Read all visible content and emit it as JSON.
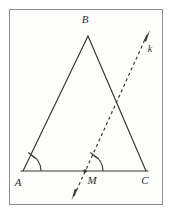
{
  "figure": {
    "background_color": "#fdfdfb",
    "page_background": "#ffffff",
    "stroke_color": "#3a3a3a",
    "border_color": "#8d8d8d",
    "frame": {
      "x": 9,
      "y": 9,
      "width": 154,
      "height": 196
    },
    "labels": {
      "apex": "B",
      "left_base": "A",
      "midpoint": "M",
      "right_base": "C",
      "ray": "k"
    },
    "points": {
      "A": {
        "x": 23,
        "y": 171
      },
      "B": {
        "x": 88,
        "y": 36
      },
      "C": {
        "x": 146,
        "y": 171
      },
      "M": {
        "x": 85,
        "y": 171
      }
    },
    "label_positions": {
      "B": {
        "x": 85,
        "y": 23
      },
      "A": {
        "x": 18,
        "y": 186
      },
      "M": {
        "x": 90,
        "y": 184
      },
      "C": {
        "x": 143,
        "y": 184
      },
      "k": {
        "x": 150,
        "y": 52
      }
    },
    "ray": {
      "name": "k",
      "through": "M",
      "arrow_head_top": {
        "x": 150,
        "y": 31
      },
      "arrow_head_bottom": {
        "x": 72,
        "y": 199
      },
      "style": "dashed",
      "dash_pattern": "3 3"
    },
    "angles": [
      {
        "name": "angle-A",
        "vertex": "A",
        "radius": 18,
        "mark": "single-tick"
      },
      {
        "name": "angle-M",
        "vertex": "M",
        "radius": 18,
        "mark": "single-tick"
      }
    ]
  }
}
